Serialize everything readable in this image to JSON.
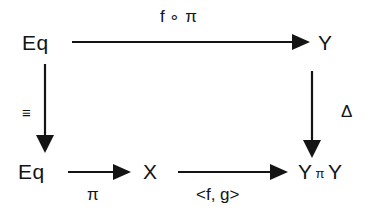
{
  "diagram": {
    "ink_color": "#141414",
    "background_color": "#ffffff",
    "nodes": [
      {
        "id": "top-left",
        "label": "Eq",
        "x": 22,
        "y": 32
      },
      {
        "id": "top-right",
        "label": "Y",
        "x": 318,
        "y": 32
      },
      {
        "id": "bottom-left",
        "label": "Eq",
        "x": 18,
        "y": 161
      },
      {
        "id": "bottom-mid",
        "label": "X",
        "x": 143,
        "y": 161
      },
      {
        "id": "bottom-right-y1",
        "label": "Y",
        "x": 298,
        "y": 161
      },
      {
        "id": "bottom-right-prod",
        "label": "π",
        "x": 321,
        "y": 167
      },
      {
        "id": "bottom-right-y2",
        "label": "Y",
        "x": 342,
        "y": 161
      }
    ],
    "edges": [
      {
        "id": "top-edge",
        "from": "Eq",
        "to": "Y",
        "label": "f ∘ π",
        "label_x": 160,
        "label_y": 8,
        "direction": "right"
      },
      {
        "id": "left-edge",
        "from": "Eq",
        "to": "Eq",
        "label": "≡",
        "label_x": 22,
        "label_y": 105,
        "direction": "down"
      },
      {
        "id": "right-edge",
        "from": "Y",
        "to": "Y π Y",
        "label": "Δ",
        "label_x": 341,
        "label_y": 103,
        "direction": "down"
      },
      {
        "id": "bottom-edge-1",
        "from": "Eq",
        "to": "X",
        "label": "π",
        "label_x": 87,
        "label_y": 186,
        "direction": "right"
      },
      {
        "id": "bottom-edge-2",
        "from": "X",
        "to": "Y π Y",
        "label": "<f, g>",
        "label_x": 196,
        "label_y": 186,
        "direction": "right"
      }
    ]
  }
}
